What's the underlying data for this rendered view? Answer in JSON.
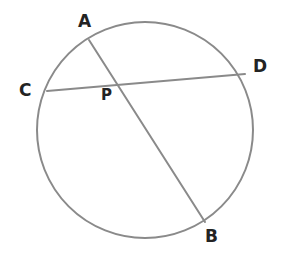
{
  "figure": {
    "background_color": "#ffffff",
    "stroke_color": "#8a8a8a",
    "label_color": "#232323",
    "stroke_width": 2
  },
  "circle": {
    "name": "circle-outline",
    "center_x": 145,
    "center_y": 130,
    "radius": 108
  },
  "points": {
    "A": {
      "label": "A",
      "x": 89,
      "y": 40,
      "label_x": 78,
      "label_y": 13
    },
    "B": {
      "label": "B",
      "x": 205,
      "y": 222,
      "label_x": 205,
      "label_y": 228
    },
    "C": {
      "label": "C",
      "x": 47,
      "y": 91,
      "label_x": 19,
      "label_y": 82
    },
    "D": {
      "label": "D",
      "x": 245,
      "y": 74,
      "label_x": 253,
      "label_y": 58
    },
    "P": {
      "label": "P",
      "x": 118,
      "y": 83,
      "label_x": 101,
      "label_y": 88
    }
  },
  "chords": [
    {
      "name": "chord-AB",
      "label": "AB",
      "from": "A",
      "to": "B",
      "x1": 89,
      "y1": 40,
      "x2": 205,
      "y2": 222
    },
    {
      "name": "chord-CD",
      "label": "CD",
      "from": "C",
      "to": "D",
      "x1": 47,
      "y1": 91,
      "x2": 245,
      "y2": 74
    }
  ],
  "intersection": {
    "name": "intersection-point-P",
    "label": "P",
    "x": 118,
    "y": 83
  }
}
